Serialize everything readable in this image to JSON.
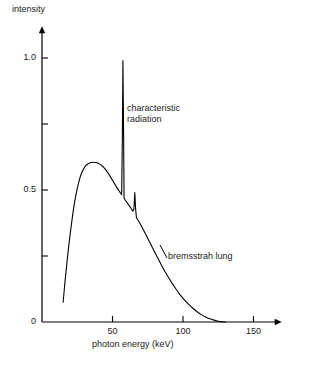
{
  "chart_data": {
    "type": "line",
    "title": "",
    "xlabel": "photon energy (keV)",
    "ylabel": "intensity",
    "xlim": [
      0,
      170
    ],
    "ylim": [
      0,
      1.12
    ],
    "grid": false,
    "legend": "none",
    "xticks": [
      {
        "value": 50,
        "label": "50"
      },
      {
        "value": 100,
        "label": "100"
      },
      {
        "value": 150,
        "label": "150"
      }
    ],
    "yticks": [
      {
        "value": 0,
        "label": "0"
      },
      {
        "value": 0.25,
        "label": ""
      },
      {
        "value": 0.5,
        "label": "0.5"
      },
      {
        "value": 0.75,
        "label": ""
      },
      {
        "value": 1.0,
        "label": "1.0"
      }
    ],
    "annotations": [
      {
        "name": "characteristic-radiation",
        "text": "characteristic\nradiation",
        "line1": "characteristic",
        "line2": "radiation",
        "x": 60,
        "y": 0.78
      },
      {
        "name": "bremsstrahlung",
        "text": "bremsstrah lung",
        "x": 89,
        "y": 0.3
      }
    ],
    "series": [
      {
        "name": "x-ray spectrum",
        "color": "#000000",
        "points": [
          [
            15.0,
            0.075
          ],
          [
            16.0,
            0.135
          ],
          [
            17.5,
            0.215
          ],
          [
            19.0,
            0.29
          ],
          [
            21.0,
            0.375
          ],
          [
            23.0,
            0.45
          ],
          [
            25.0,
            0.505
          ],
          [
            27.0,
            0.548
          ],
          [
            29.0,
            0.575
          ],
          [
            31.0,
            0.592
          ],
          [
            33.0,
            0.6
          ],
          [
            35.0,
            0.604
          ],
          [
            37.0,
            0.605
          ],
          [
            39.0,
            0.603
          ],
          [
            41.0,
            0.598
          ],
          [
            43.0,
            0.59
          ],
          [
            45.0,
            0.578
          ],
          [
            47.0,
            0.563
          ],
          [
            49.0,
            0.546
          ],
          [
            51.0,
            0.528
          ],
          [
            53.0,
            0.51
          ],
          [
            55.0,
            0.494
          ],
          [
            56.5,
            0.482
          ],
          [
            57.0,
            0.7
          ],
          [
            57.4,
            0.99
          ],
          [
            57.9,
            0.7
          ],
          [
            58.2,
            0.47
          ],
          [
            59.0,
            0.462
          ],
          [
            61.0,
            0.447
          ],
          [
            63.0,
            0.432
          ],
          [
            64.5,
            0.42
          ],
          [
            65.2,
            0.428
          ],
          [
            65.8,
            0.49
          ],
          [
            66.4,
            0.428
          ],
          [
            67.0,
            0.395
          ],
          [
            69.0,
            0.378
          ],
          [
            71.0,
            0.358
          ],
          [
            74.0,
            0.328
          ],
          [
            77.0,
            0.296
          ],
          [
            80.0,
            0.264
          ],
          [
            83.0,
            0.233
          ],
          [
            86.0,
            0.203
          ],
          [
            89.0,
            0.175
          ],
          [
            92.0,
            0.149
          ],
          [
            95.0,
            0.125
          ],
          [
            98.0,
            0.103
          ],
          [
            101.0,
            0.084
          ],
          [
            104.0,
            0.067
          ],
          [
            107.0,
            0.052
          ],
          [
            110.0,
            0.039
          ],
          [
            113.0,
            0.028
          ],
          [
            116.0,
            0.019
          ],
          [
            119.0,
            0.012
          ],
          [
            122.0,
            0.007
          ],
          [
            125.0,
            0.003
          ],
          [
            128.0,
            0.001
          ],
          [
            130.0,
            0.0
          ]
        ]
      }
    ]
  }
}
